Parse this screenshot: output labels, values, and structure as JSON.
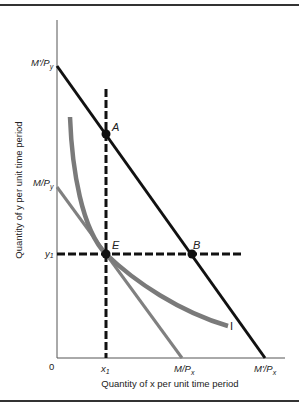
{
  "diagram": {
    "type": "indifference-curve / budget-constraint",
    "xlabel": "Quantity of x per unit time period",
    "ylabel": "Quantity of y per unit time period",
    "origin_label": "0",
    "y_ticks": [
      {
        "main": "M'/P",
        "sub": "y",
        "id": "high-budget-y-intercept"
      },
      {
        "main": "M/P",
        "sub": "y",
        "id": "low-budget-y-intercept"
      },
      {
        "main": "y",
        "sub": "1",
        "id": "y1"
      }
    ],
    "x_ticks": [
      {
        "main": "x",
        "sub": "1",
        "id": "x1"
      },
      {
        "main": "M/P",
        "sub": "x",
        "id": "low-budget-x-intercept"
      },
      {
        "main": "M'/P",
        "sub": "x",
        "id": "high-budget-x-intercept"
      }
    ],
    "points": {
      "A": "A",
      "B": "B",
      "E": "E"
    },
    "curve_label": "I",
    "colors": {
      "budget_line_high": "#111111",
      "budget_line_low": "#808080",
      "indifference_curve": "#7a7a7a",
      "dashed_lines": "#111111",
      "axes": "#555555"
    }
  }
}
